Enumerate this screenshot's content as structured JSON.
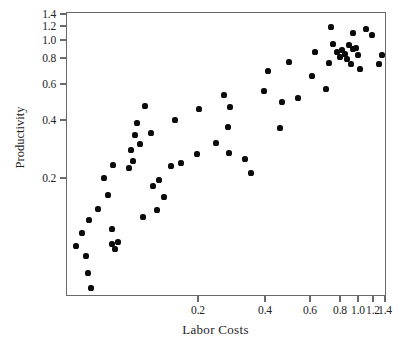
{
  "chart_data": {
    "type": "scatter",
    "title": "",
    "xlabel": "Labor Costs",
    "ylabel": "Productivity",
    "xlim": [
      0.0,
      1.42
    ],
    "ylim": [
      0.0,
      1.42
    ],
    "grid": false,
    "legend": null,
    "xticks": [
      0.2,
      0.4,
      0.6,
      0.8,
      1.0,
      1.2,
      1.4
    ],
    "xtick_labels": [
      "0.2",
      "0.4",
      "0.6",
      "0.8",
      "1.0",
      "1.2",
      "1.4"
    ],
    "xtick_px": [
      198,
      265,
      310,
      340,
      358,
      373,
      385
    ],
    "yticks": [
      0.2,
      0.4,
      0.6,
      0.8,
      1.0,
      1.2,
      1.4
    ],
    "ytick_labels": [
      "0.2",
      "0.4",
      "0.6",
      "0.8",
      "1.0",
      "1.2",
      "1.4"
    ],
    "ytick_px": [
      178,
      120,
      84,
      58,
      40,
      26,
      14
    ],
    "marker": "filled-circle",
    "marker_color": "#0b0b0b",
    "frame_color": "#6a6a6a",
    "axis_note": "Both axes are non-linear (compressed toward high values), as printed.",
    "n_points": 66,
    "points_px": [
      [
        75,
        245
      ],
      [
        81,
        232
      ],
      [
        85,
        255
      ],
      [
        87,
        272
      ],
      [
        90,
        287
      ],
      [
        88,
        219
      ],
      [
        97,
        208
      ],
      [
        111,
        243
      ],
      [
        117,
        241
      ],
      [
        107,
        194
      ],
      [
        103,
        177
      ],
      [
        112,
        164
      ],
      [
        114,
        248
      ],
      [
        111,
        228
      ],
      [
        128,
        167
      ],
      [
        132,
        160
      ],
      [
        130,
        149
      ],
      [
        134,
        134
      ],
      [
        139,
        143
      ],
      [
        142,
        216
      ],
      [
        136,
        122
      ],
      [
        144,
        105
      ],
      [
        156,
        209
      ],
      [
        152,
        185
      ],
      [
        163,
        196
      ],
      [
        158,
        179
      ],
      [
        150,
        132
      ],
      [
        170,
        165
      ],
      [
        180,
        162
      ],
      [
        174,
        119
      ],
      [
        196,
        153
      ],
      [
        198,
        108
      ],
      [
        215,
        142
      ],
      [
        223,
        94
      ],
      [
        227,
        126
      ],
      [
        228,
        152
      ],
      [
        229,
        106
      ],
      [
        244,
        158
      ],
      [
        250,
        172
      ],
      [
        263,
        90
      ],
      [
        267,
        70
      ],
      [
        279,
        127
      ],
      [
        281,
        101
      ],
      [
        288,
        61
      ],
      [
        297,
        97
      ],
      [
        311,
        75
      ],
      [
        314,
        51
      ],
      [
        325,
        88
      ],
      [
        328,
        62
      ],
      [
        332,
        43
      ],
      [
        330,
        26
      ],
      [
        336,
        51
      ],
      [
        339,
        56
      ],
      [
        341,
        49
      ],
      [
        344,
        53
      ],
      [
        346,
        58
      ],
      [
        348,
        44
      ],
      [
        350,
        63
      ],
      [
        352,
        48
      ],
      [
        352,
        32
      ],
      [
        355,
        47
      ],
      [
        357,
        54
      ],
      [
        359,
        68
      ],
      [
        365,
        28
      ],
      [
        371,
        34
      ],
      [
        381,
        54
      ],
      [
        378,
        63
      ]
    ]
  }
}
